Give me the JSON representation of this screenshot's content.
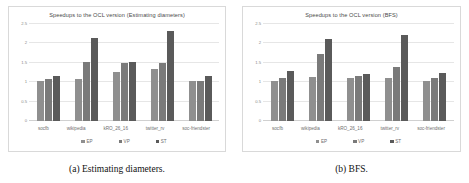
{
  "figure": {
    "captions": [
      "(a) Estimating diameters.",
      "(b) BFS."
    ]
  },
  "legend": {
    "items": [
      {
        "label": "EP",
        "color": "#8f8f8f"
      },
      {
        "label": "VP",
        "color": "#7a7a7a"
      },
      {
        "label": "ST",
        "color": "#5a5a5a"
      }
    ]
  },
  "chart_data": [
    {
      "type": "bar",
      "title": "Speedups to the OCL version (Estimating diameters)",
      "xlabel": "",
      "ylabel": "",
      "ylim": [
        0,
        2.5
      ],
      "yticks": [
        "0",
        "0.5",
        "1",
        "1.5",
        "2",
        "2.5"
      ],
      "grid": true,
      "legend_position": "bottom",
      "categories": [
        "socfb",
        "wikipedia",
        "kRO_26_16",
        "twitter_rv",
        "soc-friendster"
      ],
      "series": [
        {
          "name": "EP",
          "values": [
            1.04,
            1.09,
            1.26,
            1.34,
            1.04
          ]
        },
        {
          "name": "VP",
          "values": [
            1.08,
            1.52,
            1.5,
            1.5,
            1.03
          ]
        },
        {
          "name": "ST",
          "values": [
            1.16,
            2.13,
            1.53,
            2.32,
            1.16
          ]
        }
      ]
    },
    {
      "type": "bar",
      "title": "Speedups to the OCL version (BFS)",
      "xlabel": "",
      "ylabel": "",
      "ylim": [
        0,
        2.5
      ],
      "yticks": [
        "0",
        "0.5",
        "1",
        "1.5",
        "2",
        "2.5"
      ],
      "grid": true,
      "legend_position": "bottom",
      "categories": [
        "socfb",
        "wikipedia",
        "kRO_26_16",
        "twitter_rv",
        "soc-friendster"
      ],
      "series": [
        {
          "name": "EP",
          "values": [
            1.04,
            1.13,
            1.1,
            1.11,
            1.02
          ]
        },
        {
          "name": "VP",
          "values": [
            1.1,
            1.74,
            1.17,
            1.38,
            1.1
          ]
        },
        {
          "name": "ST",
          "values": [
            1.28,
            2.12,
            1.22,
            2.22,
            1.23
          ]
        }
      ]
    }
  ]
}
